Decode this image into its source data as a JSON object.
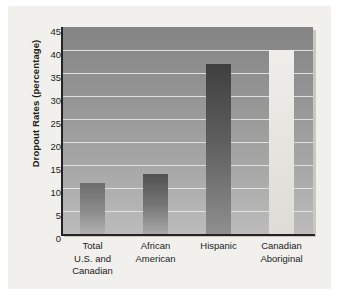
{
  "chart_data": {
    "type": "bar",
    "title": "",
    "xlabel": "",
    "ylabel": "Dropout Rates (percentage)",
    "categories": [
      "Total U.S. and Canadian",
      "African American",
      "Hispanic",
      "Canadian Aboriginal"
    ],
    "category_lines": [
      [
        "Total",
        "U.S. and",
        "Canadian"
      ],
      [
        "African",
        "American"
      ],
      [
        "Hispanic"
      ],
      [
        "Canadian",
        "Aboriginal"
      ]
    ],
    "values": [
      11,
      13,
      37,
      40
    ],
    "ylim": [
      0,
      45
    ],
    "yticks": [
      0,
      5,
      10,
      15,
      20,
      25,
      30,
      35,
      40,
      45
    ],
    "ytick_labels": [
      "0",
      "5",
      "10",
      "15",
      "20",
      "25",
      "30",
      "35",
      "40",
      "45"
    ],
    "grid": true,
    "grid_axis": "y",
    "legend": false,
    "legend_position": "none",
    "bar_colors": [
      "#8b8b8b",
      "#757575",
      "#5e5e5e",
      "#e6e4df"
    ]
  },
  "colors": {
    "page_background": "#ffffff",
    "card_background": "#f1f0ed",
    "plot_background_top": "#848484",
    "plot_background_bottom": "#bcbcbc",
    "gridline": "#e6e5e1",
    "axis": "#232323",
    "text": "#1c1c1c",
    "shadow": "#c9c7c2"
  }
}
